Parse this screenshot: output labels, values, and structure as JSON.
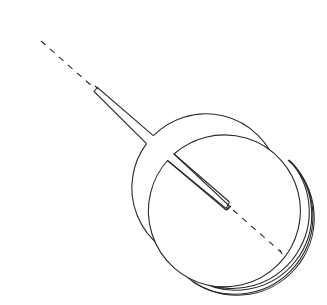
{
  "diagram": {
    "title": "",
    "background": "#ffffff",
    "line_color": "#2a2a2a",
    "elements": [
      {
        "name": "disk-top-left",
        "type": "slotted-circle",
        "center": [
          96,
          89
        ],
        "radius": 74,
        "slot": {
          "from": [
            146,
            139
          ],
          "to": [
            95,
            94
          ],
          "width": 5
        },
        "dashed_line": {
          "from": [
            40,
            41
          ],
          "to": [
            94,
            91
          ]
        }
      },
      {
        "name": "disk-bottom-right",
        "type": "slotted-circle-stack",
        "center": [
          229,
          206
        ],
        "radius": 76,
        "stack_count": 3,
        "stack_offset": [
          5,
          4
        ],
        "slot": {
          "from": [
            171,
            155
          ],
          "to": [
            230,
            206
          ],
          "width": 5
        },
        "dashed_line": {
          "from": [
            230,
            208
          ],
          "to": [
            281,
            253
          ]
        }
      }
    ],
    "labels": []
  }
}
